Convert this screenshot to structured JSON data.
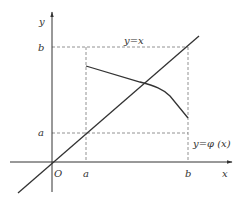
{
  "diagram": {
    "type": "function-graph",
    "axes": {
      "x_label": "x",
      "y_label": "y",
      "origin_label": "O"
    },
    "ticks": {
      "x_a": "a",
      "x_b": "b",
      "y_a": "a",
      "y_b": "b"
    },
    "curves": {
      "identity_label": "y=x",
      "phi_label": "y=φ (x)"
    },
    "colors": {
      "stroke": "#333333",
      "dashed": "#777777",
      "background": "#ffffff"
    }
  }
}
